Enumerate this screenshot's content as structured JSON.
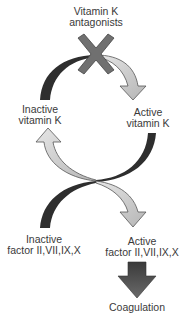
{
  "diagram": {
    "nodes": {
      "antagonists": {
        "line1": "Vitamin K",
        "line2": "antagonists"
      },
      "inactive_vitamin_k": {
        "line1": "Inactive",
        "line2": "vitamin K"
      },
      "active_vitamin_k": {
        "line1": "Active",
        "line2": "vitamin K"
      },
      "inactive_factors": {
        "line1": "Inactive",
        "line2": "factor II,VII,IX,X"
      },
      "active_factors": {
        "line1": "Active",
        "line2": "factor II,VII,IX,X"
      },
      "coagulation": {
        "line1": "Coagulation"
      }
    },
    "edges": [
      {
        "from": "inactive_vitamin_k",
        "to": "active_vitamin_k",
        "style": "curved-arrow",
        "blocked_by": "antagonists"
      },
      {
        "from": "active_vitamin_k",
        "to": "inactive_vitamin_k",
        "style": "curved-arrow"
      },
      {
        "from": "inactive_factors",
        "to": "active_factors",
        "style": "curved-arrow"
      },
      {
        "from": "active_factors",
        "to": "coagulation",
        "style": "block-arrow"
      }
    ],
    "icons": {
      "inhibition_mark": "x-mark-icon",
      "block_arrow": "down-arrow-icon"
    },
    "colors": {
      "dark_band": "#2e2e2e",
      "light_arrow": "#c8c8c8",
      "light_arrow_stroke": "#555555",
      "x_mark": "#707070",
      "block_arrow": "#4a4a4a",
      "text": "#3a3a3a"
    }
  }
}
